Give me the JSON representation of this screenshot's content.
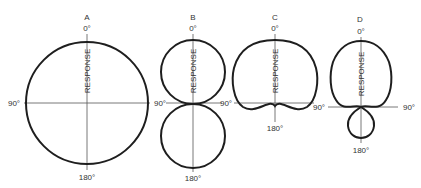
{
  "figure": {
    "panels": [
      {
        "id": "A",
        "label": "A",
        "top": "0°",
        "bottom": "180°",
        "left": "90°",
        "right": "",
        "axis_label": "RESPONSE",
        "pattern": "omnidirectional"
      },
      {
        "id": "B",
        "label": "B",
        "top": "0°",
        "bottom": "180°",
        "left": "90°",
        "right": "",
        "axis_label": "RESPONSE",
        "pattern": "bidirectional"
      },
      {
        "id": "C",
        "label": "C",
        "top": "0°",
        "bottom": "180°",
        "left": "90°",
        "right": "",
        "axis_label": "RESPONSE",
        "pattern": "cardioid"
      },
      {
        "id": "D",
        "label": "D",
        "top": "0°",
        "bottom": "180°",
        "left": "90°",
        "right": "90°",
        "axis_label": "RESPONSE",
        "pattern": "supercardioid"
      }
    ]
  }
}
